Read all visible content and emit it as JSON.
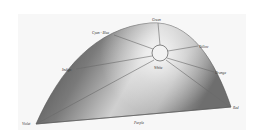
{
  "diagram": {
    "type": "color-hue-dome",
    "colors": {
      "dome_dark": "#4a4a4a",
      "dome_mid": "#8c8c8c",
      "dome_light": "#e2e2e2",
      "spoke": "#6a6a6a",
      "panel": "#f7f7f7",
      "label": "#333333"
    },
    "center": {
      "label": "White",
      "x": 160,
      "y": 53,
      "r": 8
    },
    "labels": {
      "green": "Green",
      "cyan_blue": "Cyan - Blue",
      "yellow": "Yellow",
      "indigo": "Indigo",
      "white": "White",
      "orange": "Orange",
      "violet": "Violet",
      "purple": "Purple",
      "red": "Red"
    }
  }
}
